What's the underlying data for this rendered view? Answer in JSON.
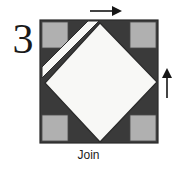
{
  "step": {
    "number": "3",
    "caption": "Join"
  },
  "colors": {
    "background": "#ffffff",
    "block_dark": "#3a3a3a",
    "corner_gray": "#b0b0b0",
    "diamond_white": "#f8f8f6",
    "outline": "#2a2a2a",
    "arrow": "#161616",
    "text": "#1a1a1a"
  },
  "block": {
    "x": 40,
    "y": 20,
    "width": 118,
    "height": 123,
    "corner_square_size": 26,
    "corner_squares": [
      {
        "name": "top-left",
        "x": 42,
        "y": 22
      },
      {
        "name": "top-right",
        "x": 130,
        "y": 22
      },
      {
        "name": "bottom-left",
        "x": 42,
        "y": 115
      },
      {
        "name": "bottom-right",
        "x": 130,
        "y": 115
      }
    ],
    "diamond": {
      "top": [
        100,
        22
      ],
      "right": [
        157,
        82
      ],
      "bottom": [
        100,
        142
      ],
      "left": [
        44,
        82
      ]
    },
    "flap": {
      "name": "white-diagonal-flap",
      "points": "99,21 41,79 41,69 89,21"
    }
  },
  "arrows": [
    {
      "name": "top-arrow",
      "direction": "right",
      "x": 90,
      "y": 10,
      "length": 30
    },
    {
      "name": "right-arrow",
      "direction": "up",
      "x": 167,
      "y": 70,
      "length": 30
    }
  ],
  "icons": {
    "arrow_right": "arrow-right-icon",
    "arrow_up": "arrow-up-icon"
  }
}
